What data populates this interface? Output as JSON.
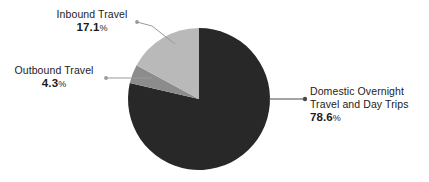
{
  "chart_data": {
    "type": "pie",
    "title": "",
    "subtitle": "",
    "xlabel": "",
    "ylabel": "",
    "legend_position": "callout-labels",
    "grid": false,
    "units": "percent",
    "start_angle_deg": 0,
    "direction": "clockwise",
    "categories": [
      "Domestic Overnight Travel and Day Trips",
      "Inbound Travel",
      "Outbound Travel"
    ],
    "values": [
      78.6,
      17.1,
      4.3
    ],
    "slices": [
      {
        "label_line1": "Domestic Overnight",
        "label_line2": "Travel and Day Trips",
        "value": 78.6,
        "value_text": "78.6",
        "percent_symbol": "%",
        "color": "#282828"
      },
      {
        "label_line1": "Inbound Travel",
        "label_line2": "",
        "value": 17.1,
        "value_text": "17.1",
        "percent_symbol": "%",
        "color": "#b9b9b9"
      },
      {
        "label_line1": "Outbound Travel",
        "label_line2": "",
        "value": 4.3,
        "value_text": "4.3",
        "percent_symbol": "%",
        "color": "#8c8c8c"
      }
    ]
  },
  "colors": {
    "background": "#ffffff",
    "domestic_slice": "#282828",
    "inbound_slice": "#b9b9b9",
    "outbound_slice": "#8c8c8c",
    "leader_line": "#9a9a9a",
    "text": "#1c1c1c"
  }
}
